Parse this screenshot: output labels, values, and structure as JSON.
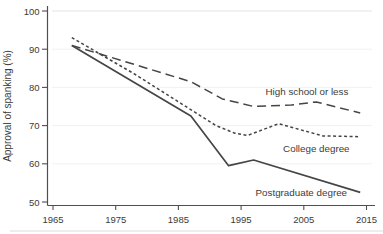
{
  "chart_data": {
    "type": "line",
    "title": "",
    "xlabel": "",
    "ylabel": "Approval of spanking (%)",
    "xlim": [
      1965,
      2015
    ],
    "ylim": [
      50,
      100
    ],
    "x_ticks": [
      1965,
      1975,
      1985,
      1995,
      2005,
      2015
    ],
    "y_ticks": [
      50,
      60,
      70,
      80,
      90,
      100
    ],
    "grid": "very faint horizontal gridlines at major y ticks",
    "legend_position": "inline labels placed next to their lines",
    "background": "#ffffff",
    "line_color": "#454545",
    "axis_color": "#4f4f4f",
    "text_color": "#3b3b3b",
    "grid_color": "#e3e3e3",
    "series": [
      {
        "name": "High school or less",
        "style": "long-dash",
        "points": [
          [
            1968,
            91
          ],
          [
            1978,
            86
          ],
          [
            1987,
            81.5
          ],
          [
            1992,
            77
          ],
          [
            1997,
            75
          ],
          [
            2003,
            75.4
          ],
          [
            2007,
            76.2
          ],
          [
            2014,
            73.3
          ]
        ],
        "label_anchor": {
          "x": 2005.5,
          "y": 78.8
        }
      },
      {
        "name": "College degree",
        "style": "short-dash",
        "points": [
          [
            1968,
            93
          ],
          [
            1978,
            83.5
          ],
          [
            1991,
            70
          ],
          [
            1994,
            68
          ],
          [
            1996,
            67.4
          ],
          [
            2001,
            70.5
          ],
          [
            2008,
            67.3
          ],
          [
            2014,
            67.1
          ]
        ],
        "label_anchor": {
          "x": 2007,
          "y": 63.9
        }
      },
      {
        "name": "Postgraduate degree",
        "style": "solid",
        "points": [
          [
            1968,
            91
          ],
          [
            1987,
            72.5
          ],
          [
            1993,
            59.5
          ],
          [
            1997,
            61
          ],
          [
            2014,
            52.5
          ]
        ],
        "label_anchor": {
          "x": 2004.6,
          "y": 52.4
        }
      }
    ]
  }
}
